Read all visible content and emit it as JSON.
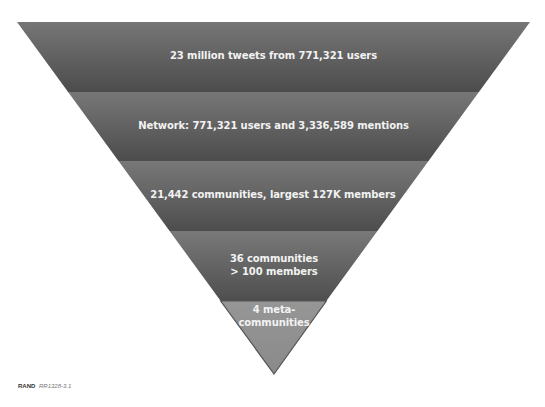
{
  "diagram": {
    "type": "inverted-funnel",
    "bands": [
      {
        "label_lines": [
          "23 million tweets from 771,321 users"
        ],
        "fill_top": "#747474",
        "fill_bottom": "#4e4e4e"
      },
      {
        "label_lines": [
          "Network: 771,321 users and 3,336,589 mentions"
        ],
        "fill_top": "#757575",
        "fill_bottom": "#4e4e4e"
      },
      {
        "label_lines": [
          "21,442 communities, largest 127K members"
        ],
        "fill_top": "#767676",
        "fill_bottom": "#4f4f4f"
      },
      {
        "label_lines": [
          "36 communities",
          "> 100 members"
        ],
        "fill_top": "#777777",
        "fill_bottom": "#505050"
      },
      {
        "label_lines": [
          "4 meta-",
          "communities"
        ],
        "fill_top": "#949494",
        "fill_bottom": "#8a8a8a"
      }
    ]
  },
  "credit": {
    "org": "RAND",
    "code": "RR1328-3.1"
  }
}
